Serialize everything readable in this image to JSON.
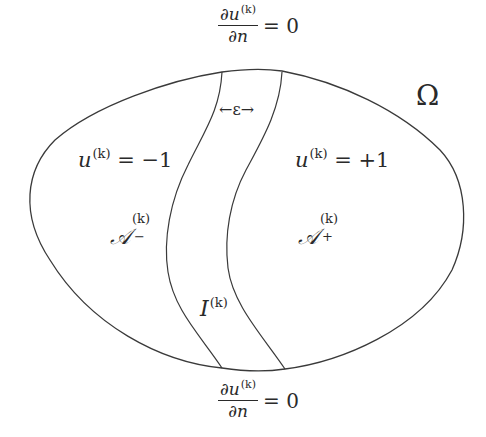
{
  "figure": {
    "colors": {
      "stroke": "#3a3a3a",
      "text": "#2a2a2a",
      "background": "#ffffff"
    },
    "domain_label": "Ω",
    "top_bc": {
      "numerator_base": "∂u",
      "numerator_sup": "(k)",
      "denominator": "∂n",
      "rhs": "= 0"
    },
    "bottom_bc": {
      "numerator_base": "∂u",
      "numerator_sup": "(k)",
      "denominator": "∂n",
      "rhs": "= 0"
    },
    "epsilon_label": "←ε→",
    "left_region": {
      "value_base": "u",
      "value_sup": "(k)",
      "value_rhs": "= −1",
      "set_base": "𝒜",
      "set_sup": "(k)",
      "set_sub": "−"
    },
    "right_region": {
      "value_base": "u",
      "value_sup": "(k)",
      "value_rhs": "= +1",
      "set_base": "𝒜",
      "set_sup": "(k)",
      "set_sub": "+"
    },
    "interface": {
      "base": "I",
      "sup": "(k)"
    }
  }
}
